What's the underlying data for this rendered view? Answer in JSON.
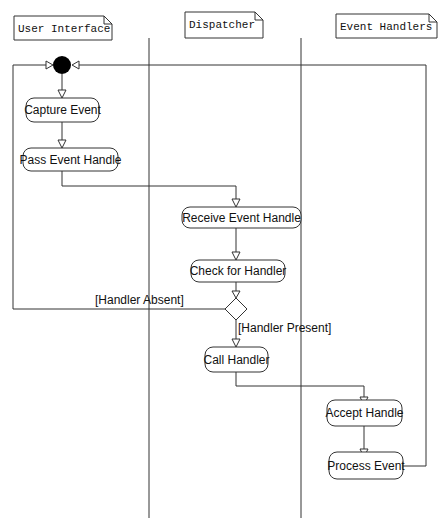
{
  "diagram": {
    "type": "UML activity diagram with swimlanes",
    "lanes": [
      {
        "id": "ui",
        "label": "User Interface"
      },
      {
        "id": "dispatcher",
        "label": "Dispatcher"
      },
      {
        "id": "handlers",
        "label": "Event Handlers"
      }
    ],
    "nodes": {
      "start": {
        "kind": "initial",
        "lane": "ui"
      },
      "capture": {
        "label": "Capture Event",
        "lane": "ui"
      },
      "pass": {
        "label": "Pass Event Handle",
        "lane": "ui"
      },
      "receive": {
        "label": "Receive Event Handle",
        "lane": "dispatcher"
      },
      "check": {
        "label": "Check for Handler",
        "lane": "dispatcher"
      },
      "decision": {
        "kind": "decision",
        "lane": "dispatcher"
      },
      "call": {
        "label": "Call Handler",
        "lane": "dispatcher"
      },
      "accept": {
        "label": "Accept Handle",
        "lane": "handlers"
      },
      "process": {
        "label": "Process Event",
        "lane": "handlers"
      }
    },
    "guards": {
      "absent": "[Handler Absent]",
      "present": "[Handler Present]"
    },
    "edges": [
      {
        "from": "start",
        "to": "capture"
      },
      {
        "from": "capture",
        "to": "pass"
      },
      {
        "from": "pass",
        "to": "receive"
      },
      {
        "from": "receive",
        "to": "check"
      },
      {
        "from": "check",
        "to": "decision"
      },
      {
        "from": "decision",
        "to": "start",
        "guard": "[Handler Absent]"
      },
      {
        "from": "decision",
        "to": "call",
        "guard": "[Handler Present]"
      },
      {
        "from": "call",
        "to": "accept"
      },
      {
        "from": "accept",
        "to": "process"
      },
      {
        "from": "process",
        "to": "start"
      }
    ]
  }
}
